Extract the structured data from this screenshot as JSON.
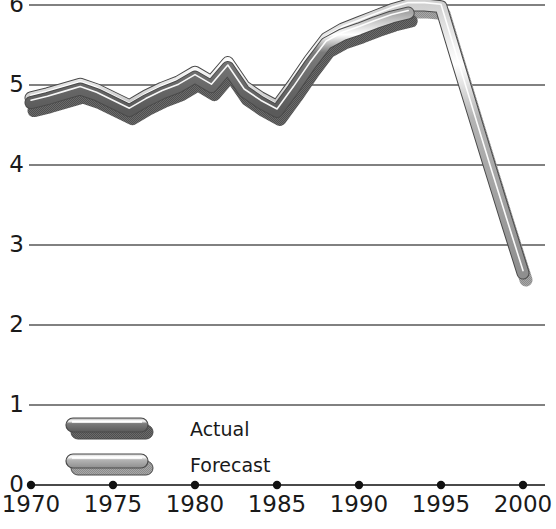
{
  "chart_data": {
    "type": "line",
    "title": "",
    "xlabel": "",
    "ylabel": "",
    "xlim": [
      1970,
      2000
    ],
    "ylim": [
      0,
      6
    ],
    "grid": true,
    "y_ticks": [
      "0",
      "1",
      "2",
      "3",
      "4",
      "5",
      "6"
    ],
    "y_tick_values": [
      0,
      1,
      2,
      3,
      4,
      5,
      6
    ],
    "x_ticks": [
      "1970",
      "1975",
      "1980",
      "1985",
      "1990",
      "1995",
      "2000"
    ],
    "x_tick_values": [
      1970,
      1975,
      1980,
      1985,
      1990,
      1995,
      2000
    ],
    "legend_position": "inside-bottom-left",
    "series": [
      {
        "name": "Actual",
        "color": "#6f6f6f",
        "x": [
          1970,
          1971,
          1972,
          1973,
          1974,
          1975,
          1976,
          1977,
          1978,
          1979,
          1980,
          1981,
          1982,
          1983,
          1984,
          1985,
          1986,
          1987,
          1988,
          1989,
          1990,
          1991,
          1992,
          1993
        ],
        "values": [
          4.78,
          4.83,
          4.89,
          4.95,
          4.88,
          4.78,
          4.68,
          4.8,
          4.9,
          4.98,
          5.1,
          4.98,
          5.22,
          4.92,
          4.78,
          4.67,
          4.95,
          5.25,
          5.52,
          5.63,
          5.7,
          5.78,
          5.85,
          5.9
        ]
      },
      {
        "name": "Forecast",
        "color": "#9a9a9a",
        "x": [
          1970,
          1971,
          1972,
          1973,
          1974,
          1975,
          1976,
          1977,
          1978,
          1979,
          1980,
          1981,
          1982,
          1983,
          1984,
          1985,
          1986,
          1987,
          1988,
          1989,
          1990,
          1991,
          1992,
          1993,
          1994,
          1995,
          1996,
          1997,
          1998,
          1999,
          2000
        ],
        "values": [
          4.84,
          4.89,
          4.95,
          5.01,
          4.94,
          4.84,
          4.74,
          4.86,
          4.96,
          5.04,
          5.16,
          5.04,
          5.28,
          4.98,
          4.84,
          4.73,
          5.01,
          5.31,
          5.58,
          5.7,
          5.78,
          5.86,
          5.94,
          6.0,
          6.0,
          5.98,
          5.3,
          4.63,
          3.96,
          3.3,
          2.65
        ]
      }
    ]
  },
  "legend": {
    "entries": [
      {
        "label": "Actual",
        "series": "Actual"
      },
      {
        "label": "Forecast",
        "series": "Forecast"
      }
    ]
  },
  "colors": {
    "actual_top": "#9b9b9b",
    "actual_highlight": "#ffffff",
    "actual_body": "#636363",
    "actual_shadow": "#8b8b8b",
    "forecast_top": "#c2c2c2",
    "forecast_highlight": "#ffffff",
    "forecast_body": "#9d9d9d",
    "forecast_shadow": "#8b8b8b",
    "gridline": "#575757",
    "axis": "#4a4a4a",
    "text": "#1a1a1a",
    "background": "#ffffff"
  }
}
